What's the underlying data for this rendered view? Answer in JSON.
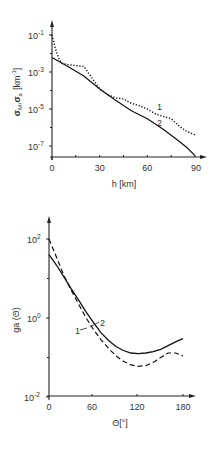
{
  "chart_data": [
    {
      "type": "line",
      "title": "",
      "xlabel": "h [km]",
      "ylabel": "σM, σa [km⁻¹]",
      "yscale": "log",
      "xlim": [
        0,
        92
      ],
      "ylim": [
        3e-08,
        0.5
      ],
      "x_ticks": [
        0,
        30,
        60,
        90
      ],
      "y_ticks": [
        "10^-1",
        "10^-3",
        "10^-5",
        "10^-7"
      ],
      "grid": false,
      "series": [
        {
          "name": "1",
          "style": "dotted",
          "x": [
            0,
            2,
            4,
            6,
            10,
            15,
            20,
            25,
            30,
            35,
            40,
            45,
            50,
            55,
            60,
            65,
            70,
            75,
            80,
            85,
            90
          ],
          "y": [
            0.1,
            0.02,
            0.006,
            0.003,
            0.0025,
            0.0022,
            0.002,
            0.0005,
            0.00012,
            6e-05,
            4e-05,
            3.5e-05,
            2e-05,
            1.5e-05,
            1e-05,
            5.5e-06,
            4e-06,
            3e-06,
            1.2e-06,
            6e-07,
            4e-07
          ]
        },
        {
          "name": "2",
          "style": "solid",
          "x": [
            0,
            10,
            20,
            30,
            40,
            50,
            60,
            70,
            80,
            85,
            90
          ],
          "y": [
            0.006,
            0.002,
            0.0006,
            0.00012,
            3e-05,
            8e-06,
            3e-06,
            8e-07,
            1.8e-07,
            8e-08,
            3e-08
          ]
        }
      ],
      "annotations": [
        {
          "text": "1",
          "near": "dotted curve at h≈67"
        },
        {
          "text": "2",
          "near": "solid curve at h≈68"
        }
      ]
    },
    {
      "type": "line",
      "title": "",
      "xlabel": "Θ [°]",
      "ylabel": "ga (Θ)",
      "yscale": "log",
      "xlim": [
        0,
        190
      ],
      "ylim": [
        0.01,
        500
      ],
      "x_ticks": [
        0,
        60,
        120,
        180
      ],
      "y_ticks": [
        "10^2",
        "10^0",
        "10^-2"
      ],
      "grid": false,
      "series": [
        {
          "name": "1",
          "style": "dashed",
          "x": [
            0,
            10,
            20,
            30,
            40,
            50,
            60,
            70,
            80,
            90,
            100,
            110,
            120,
            130,
            140,
            150,
            160,
            170,
            180
          ],
          "y": [
            100,
            35,
            12,
            5,
            2.2,
            1.0,
            0.5,
            0.28,
            0.17,
            0.11,
            0.08,
            0.065,
            0.06,
            0.062,
            0.075,
            0.1,
            0.13,
            0.13,
            0.11
          ]
        },
        {
          "name": "2",
          "style": "solid",
          "x": [
            0,
            10,
            20,
            30,
            40,
            50,
            60,
            70,
            80,
            90,
            100,
            110,
            120,
            130,
            140,
            150,
            160,
            170,
            180
          ],
          "y": [
            40,
            22,
            11,
            5.5,
            2.8,
            1.4,
            0.75,
            0.42,
            0.27,
            0.19,
            0.15,
            0.13,
            0.125,
            0.13,
            0.14,
            0.16,
            0.2,
            0.25,
            0.3
          ]
        }
      ],
      "annotations": [
        {
          "text": "1",
          "near": "dashed curve at Θ≈55"
        },
        {
          "text": "2",
          "near": "solid curve at Θ≈60"
        }
      ]
    }
  ],
  "top_chart": {
    "ylabel_main": "σ",
    "ylabel_sub1": "M",
    "ylabel_sep": ",",
    "ylabel_main2": "σ",
    "ylabel_sub2": "a",
    "ylabel_unit": "[km",
    "ylabel_unit_exp": "-1",
    "ylabel_unit_close": "]",
    "xlabel": "h [km]",
    "x_tick_labels": [
      "0",
      "30",
      "60",
      "90"
    ],
    "y_tick_base": "10",
    "y_tick_exps": [
      "-1",
      "-3",
      "-5",
      "-7"
    ],
    "curve_labels": [
      "1",
      "2"
    ]
  },
  "bottom_chart": {
    "ylabel": "ga (Θ)",
    "xlabel": "Θ[°]",
    "x_tick_labels": [
      "0",
      "60",
      "120",
      "180"
    ],
    "y_tick_base": "10",
    "y_tick_exps": [
      "2",
      "0",
      "-2"
    ],
    "curve_labels": [
      "1",
      "2"
    ]
  }
}
